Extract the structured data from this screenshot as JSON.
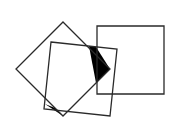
{
  "diagram": {
    "title": "",
    "stroke_color": "#2a2a2a",
    "fill_color": "#000000",
    "background": "#ffffff",
    "shapes": [
      {
        "name": "diamond-square",
        "points": "63,22 110,69 63,116 16,69"
      },
      {
        "name": "tilted-square",
        "points": "51,42 117,49 110,116 44,109"
      },
      {
        "name": "axis-square",
        "points": "97,26 164,26 164,94 97,94"
      }
    ],
    "filled_regions": [
      {
        "name": "upper-right-wedge",
        "points": "89,46 96,47 110,69 96,83"
      },
      {
        "name": "bottom-wedge",
        "points": "45,104 55,108 63,116"
      }
    ]
  }
}
